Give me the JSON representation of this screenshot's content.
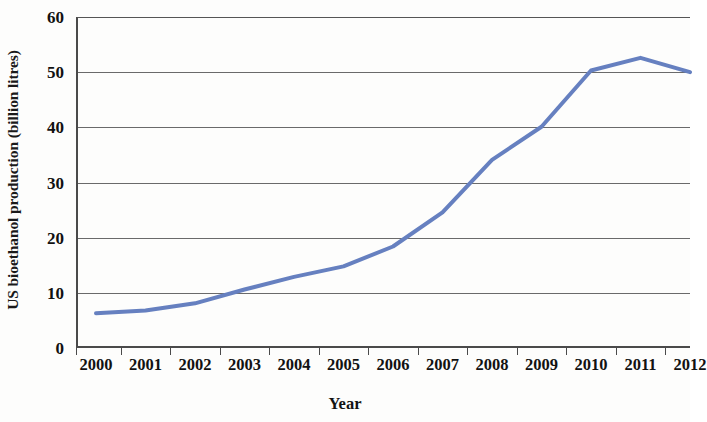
{
  "chart_data": {
    "type": "line",
    "title": "",
    "subtitle": "",
    "xlabel": "Year",
    "ylabel": "US bioethanol production (billion litres)",
    "categories": [
      "2000",
      "2001",
      "2002",
      "2003",
      "2004",
      "2005",
      "2006",
      "2007",
      "2008",
      "2009",
      "2010",
      "2011",
      "2012"
    ],
    "x": [
      2000,
      2001,
      2002,
      2003,
      2004,
      2005,
      2006,
      2007,
      2008,
      2009,
      2010,
      2011,
      2012
    ],
    "values": [
      6.3,
      6.8,
      8.1,
      10.6,
      12.9,
      14.8,
      18.4,
      24.6,
      34.1,
      40.1,
      50.3,
      52.6,
      50.0
    ],
    "series": [
      {
        "name": "US bioethanol production",
        "color": "#6680C0",
        "values": [
          6.3,
          6.8,
          8.1,
          10.6,
          12.9,
          14.8,
          18.4,
          24.6,
          34.1,
          40.1,
          50.3,
          52.6,
          50.0
        ]
      }
    ],
    "ylim": [
      0,
      60
    ],
    "ytick_values": [
      0,
      10,
      20,
      30,
      40,
      50,
      60
    ],
    "ytick_labels": [
      "0",
      "10",
      "20",
      "30",
      "40",
      "50",
      "60"
    ],
    "xlim": [
      2000,
      2012
    ],
    "grid": "horizontal",
    "legend": "none",
    "line_color": "#6680C0",
    "axis_color": "#4a4a4a",
    "gridline_color": "#6a6a6a",
    "background": "#fdfdfc",
    "annotations": []
  }
}
